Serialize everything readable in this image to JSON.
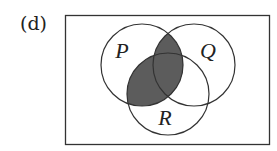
{
  "figure": {
    "label": "(d)",
    "sets": [
      {
        "name": "P",
        "cx": 142,
        "cy": 65,
        "r": 41,
        "label_x": 122,
        "label_y": 58
      },
      {
        "name": "Q",
        "cx": 194,
        "cy": 65,
        "r": 41,
        "label_x": 208,
        "label_y": 58
      },
      {
        "name": "R",
        "cx": 168,
        "cy": 94,
        "r": 41,
        "label_x": 165,
        "label_y": 125
      }
    ],
    "shaded_region": "P ∩ (Q ∪ R)",
    "colors": {
      "shade": "#5c5c5c",
      "stroke": "#333333",
      "background": "#ffffff"
    },
    "universal_set": {
      "x": 65,
      "y": 15,
      "width": 204,
      "height": 129
    }
  }
}
